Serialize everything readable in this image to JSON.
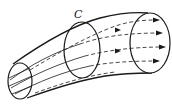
{
  "diagram": {
    "labels": {
      "cross_section": "C"
    },
    "components": {
      "left_end": "entry cross-section",
      "middle_loop": "closed curve C around tube",
      "right_end": "exit cross-section",
      "streamlines": 5
    },
    "colors": {
      "stroke": "#1a1a1a",
      "background": "#ffffff"
    }
  }
}
